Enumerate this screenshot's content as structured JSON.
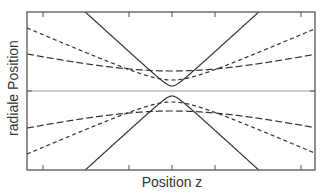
{
  "chart_data": {
    "type": "line",
    "title": "",
    "xlabel": "Position z",
    "ylabel": "radiale Position",
    "grid": false,
    "legend": null,
    "axis_line": {
      "y": 0,
      "style": "thin gray"
    },
    "ticks_x_px": [
      43,
      129,
      172,
      215,
      301
    ],
    "series": [
      {
        "name": "beam-small-waist",
        "style": "solid",
        "waist_w0": 5,
        "rayleigh_zr": 5.5
      },
      {
        "name": "beam-medium-waist",
        "style": "short-dash",
        "waist_w0": 11,
        "rayleigh_zr": 25.7
      },
      {
        "name": "beam-large-waist",
        "style": "long-dash",
        "waist_w0": 20,
        "rayleigh_zr": 93
      }
    ]
  },
  "plot": {
    "left": 27,
    "top": 12,
    "right": 315,
    "bottom": 170,
    "center_x": 172,
    "center_y": 91,
    "colors": {
      "frame": "#555555",
      "curve": "#333333",
      "axis": "#999999"
    }
  }
}
